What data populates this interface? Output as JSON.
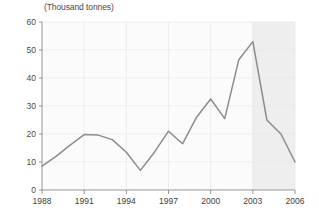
{
  "chart_data": {
    "type": "line",
    "title": "(Thousand tonnes)",
    "xlabel": "",
    "ylabel": "(Thousand tonnes)",
    "x": [
      1988,
      1989,
      1990,
      1991,
      1992,
      1993,
      1994,
      1995,
      1996,
      1997,
      1998,
      1999,
      2000,
      2001,
      2002,
      2003,
      2004,
      2005,
      2006
    ],
    "values": [
      8.5,
      12.0,
      16.0,
      19.8,
      19.6,
      18.0,
      13.5,
      7.0,
      13.5,
      21.0,
      16.5,
      26.0,
      32.5,
      25.5,
      46.5,
      53.0,
      25.0,
      20.0,
      10.0
    ],
    "categories": [
      "1988",
      "1989",
      "1990",
      "1991",
      "1992",
      "1993",
      "1994",
      "1995",
      "1996",
      "1997",
      "1998",
      "1999",
      "2000",
      "2001",
      "2002",
      "2003",
      "2004",
      "2005",
      "2006"
    ],
    "xticks": [
      1988,
      1991,
      1994,
      1997,
      2000,
      2003,
      2006
    ],
    "xtick_labels": [
      "1988",
      "1991",
      "1994",
      "1997",
      "2000",
      "2003",
      "2006"
    ],
    "yticks": [
      0,
      10,
      20,
      30,
      40,
      50,
      60
    ],
    "ytick_labels": [
      "0",
      "10",
      "20",
      "30",
      "40",
      "50",
      "60"
    ],
    "xlim": [
      1988,
      2006
    ],
    "ylim": [
      0,
      60
    ],
    "grid": true,
    "legend": null,
    "line_color": "#8c8c8c",
    "plot_background": "#fbfbfb",
    "shaded_region": {
      "label": "",
      "start": 2003,
      "end": 2006,
      "color": "#eeeeee"
    }
  }
}
